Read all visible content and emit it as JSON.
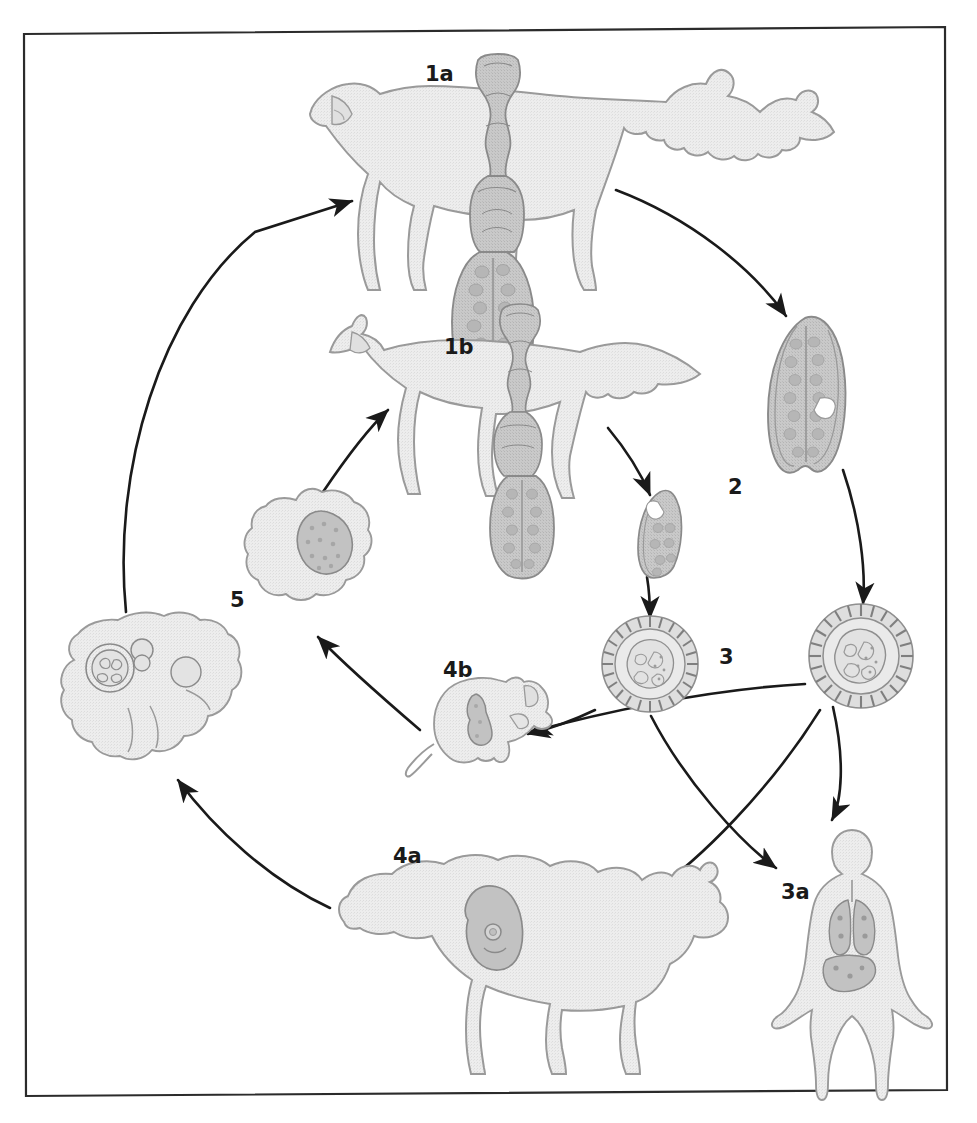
{
  "figure": {
    "frame": {
      "border_color": "#2b2b2b",
      "background": "#ffffff"
    },
    "palette": {
      "host_fill": "#ebebeb",
      "host_stroke": "#9a9a9a",
      "parasite_fill": "#c9c9c9",
      "parasite_stroke": "#8a8a8a",
      "organ_fill": "#c2c2c2",
      "organ_stroke": "#8a8a8a",
      "arrow_color": "#1a1a1a",
      "label_color": "#1a1a1a"
    }
  },
  "labels": [
    {
      "id": "1a",
      "text": "1a",
      "x": 425,
      "y": 64,
      "name": "stage-label-1a",
      "description": "definitive host dog harbouring adult tapeworm"
    },
    {
      "id": "1b",
      "text": "1b",
      "x": 444,
      "y": 337,
      "name": "stage-label-1b",
      "description": "definitive host fox harbouring adult tapeworm"
    },
    {
      "id": "2",
      "text": "2",
      "x": 728,
      "y": 477,
      "name": "stage-label-2",
      "description": "gravid proglottid shed in faeces"
    },
    {
      "id": "3",
      "text": "3",
      "x": 719,
      "y": 647,
      "name": "stage-label-3",
      "description": "embryonated egg containing oncosphere"
    },
    {
      "id": "3a",
      "text": "3a",
      "x": 781,
      "y": 882,
      "name": "stage-label-3a",
      "description": "human accidental intermediate host with hydatid cysts in lungs and liver"
    },
    {
      "id": "4a",
      "text": "4a",
      "x": 393,
      "y": 846,
      "name": "stage-label-4a",
      "description": "sheep intermediate host with hydatid cyst"
    },
    {
      "id": "4b",
      "text": "4b",
      "x": 443,
      "y": 660,
      "name": "stage-label-4b",
      "description": "rodent intermediate host with larval metacestode"
    },
    {
      "id": "5",
      "text": "5",
      "x": 230,
      "y": 590,
      "name": "stage-label-5",
      "description": "hydatid cyst in organ, infective to definitive host"
    }
  ],
  "organisms": [
    {
      "id": "dog",
      "label": "1a",
      "name": "dog-host-figure"
    },
    {
      "id": "fox",
      "label": "1b",
      "name": "fox-host-figure"
    },
    {
      "id": "tapeworm-dog",
      "label": "1a",
      "name": "adult-tapeworm-dog-figure"
    },
    {
      "id": "tapeworm-fox",
      "label": "1b",
      "name": "adult-tapeworm-fox-figure"
    },
    {
      "id": "proglottid-large",
      "label": "2",
      "name": "gravid-proglottid-figure"
    },
    {
      "id": "proglottid-small",
      "label": "2",
      "name": "gravid-proglottid-small-figure"
    },
    {
      "id": "egg-right",
      "label": "3",
      "name": "egg-right-figure"
    },
    {
      "id": "egg-center",
      "label": "3",
      "name": "egg-center-figure"
    },
    {
      "id": "human",
      "label": "3a",
      "name": "human-host-figure"
    },
    {
      "id": "sheep",
      "label": "4a",
      "name": "sheep-host-figure"
    },
    {
      "id": "rodent",
      "label": "4b",
      "name": "rodent-host-figure"
    },
    {
      "id": "cyst-organ",
      "label": "5",
      "name": "hydatid-cyst-organ-figure"
    },
    {
      "id": "liver-cysts",
      "label": "5",
      "name": "liver-with-cysts-figure"
    }
  ],
  "arrows": [
    {
      "id": "a1",
      "from": "liver-cysts",
      "to": "dog",
      "name": "arrow-liver-to-dog"
    },
    {
      "id": "a2",
      "from": "dog",
      "to": "proglottid-large",
      "name": "arrow-dog-to-proglottid"
    },
    {
      "id": "a3",
      "from": "proglottid-large",
      "to": "egg-right",
      "name": "arrow-proglottid-to-egg"
    },
    {
      "id": "a4",
      "from": "fox",
      "to": "proglottid-small",
      "name": "arrow-fox-to-proglottid-small"
    },
    {
      "id": "a5",
      "from": "proglottid-small",
      "to": "egg-center",
      "name": "arrow-proglottid-small-to-egg"
    },
    {
      "id": "a6",
      "from": "egg-center",
      "to": "rodent",
      "name": "arrow-egg-to-rodent"
    },
    {
      "id": "a7",
      "from": "egg-right",
      "to": "rodent",
      "name": "arrow-egg-right-to-rodent"
    },
    {
      "id": "a8",
      "from": "rodent",
      "to": "cyst-organ",
      "name": "arrow-rodent-to-cyst"
    },
    {
      "id": "a9",
      "from": "cyst-organ",
      "to": "fox",
      "name": "arrow-cyst-to-fox"
    },
    {
      "id": "a10",
      "from": "egg-center",
      "to": "human",
      "name": "arrow-egg-center-to-human"
    },
    {
      "id": "a11",
      "from": "egg-right",
      "to": "human",
      "name": "arrow-egg-right-to-human"
    },
    {
      "id": "a12",
      "from": "egg-right",
      "to": "sheep",
      "name": "arrow-egg-right-to-sheep"
    },
    {
      "id": "a13",
      "from": "sheep",
      "to": "liver-cysts",
      "name": "arrow-sheep-to-liver"
    }
  ]
}
